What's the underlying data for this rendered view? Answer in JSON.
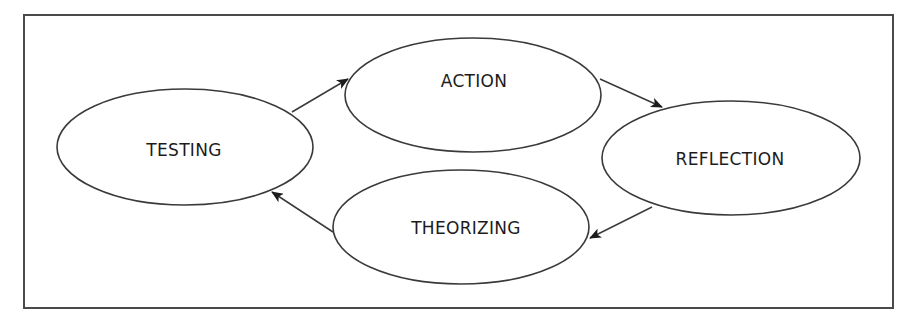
{
  "diagram": {
    "type": "cycle",
    "colors": {
      "stroke": "#3a3a3a",
      "text": "#1c1c1c",
      "background": "#ffffff",
      "frame": "#4a4a4a"
    },
    "frame": {
      "x": 24,
      "y": 15,
      "width": 869,
      "height": 293
    },
    "nodes": [
      {
        "id": "action",
        "label": "ACTION",
        "cx": 473,
        "cy": 95,
        "rx": 128,
        "ry": 57,
        "tx": 474,
        "ty": 87
      },
      {
        "id": "reflection",
        "label": "REFLECTION",
        "cx": 731,
        "cy": 158,
        "rx": 129,
        "ry": 57,
        "tx": 730,
        "ty": 165
      },
      {
        "id": "theorizing",
        "label": "THEORIZING",
        "cx": 461,
        "cy": 227,
        "rx": 128,
        "ry": 57,
        "tx": 466,
        "ty": 234
      },
      {
        "id": "testing",
        "label": "TESTING",
        "cx": 185,
        "cy": 147,
        "rx": 128,
        "ry": 58,
        "tx": 184,
        "ty": 156
      }
    ],
    "edges": [
      {
        "from": "testing",
        "to": "action",
        "x1": 292,
        "y1": 112,
        "x2": 348,
        "y2": 79
      },
      {
        "from": "action",
        "to": "reflection",
        "x1": 600,
        "y1": 79,
        "x2": 662,
        "y2": 107
      },
      {
        "from": "reflection",
        "to": "theorizing",
        "x1": 652,
        "y1": 207,
        "x2": 590,
        "y2": 238
      },
      {
        "from": "theorizing",
        "to": "testing",
        "x1": 333,
        "y1": 232,
        "x2": 272,
        "y2": 192
      }
    ]
  }
}
